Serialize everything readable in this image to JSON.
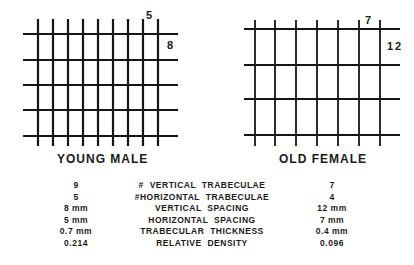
{
  "panels": [
    {
      "title": "YOUNG MALE",
      "vertical_count_label": "5",
      "horizontal_count_label": "8",
      "grid": {
        "vertical_lines_x": [
          38,
          53,
          68,
          83,
          98,
          113,
          128,
          143,
          158
        ],
        "vertical_y_range": [
          19,
          146
        ],
        "horizontal_lines_y": [
          34,
          60,
          85,
          110,
          136
        ],
        "horizontal_x_range": [
          23,
          178
        ],
        "stroke_width": 2.2
      }
    },
    {
      "title": "OLD FEMALE",
      "vertical_count_label": "7",
      "horizontal_count_label": "12",
      "grid": {
        "vertical_lines_x": [
          255,
          275,
          296,
          317,
          338,
          359,
          380
        ],
        "vertical_y_range": [
          20,
          146
        ],
        "horizontal_lines_y": [
          29,
          65,
          99,
          135
        ],
        "horizontal_x_range": [
          244,
          400
        ],
        "stroke_width": 1.8
      }
    }
  ],
  "comparison": {
    "rows": [
      {
        "young_male": "9",
        "metric": "# VERTICAL  TRABECULAE",
        "old_female": "7"
      },
      {
        "young_male": "5",
        "metric": "#HORIZONTAL  TRABECULAE",
        "old_female": "4"
      },
      {
        "young_male": "8 mm",
        "metric": "VERTICAL  SPACING",
        "old_female": "12 mm"
      },
      {
        "young_male": "5 mm",
        "metric": "HORIZONTAL  SPACING",
        "old_female": "7 mm"
      },
      {
        "young_male": "0.7 mm",
        "metric": "TRABECULAR  THICKNESS",
        "old_female": "0.4 mm"
      },
      {
        "young_male": "0.214",
        "metric": "RELATIVE  DENSITY",
        "old_female": "0.096"
      }
    ]
  },
  "colors": {
    "line": "#151515",
    "background": "#ffffff"
  }
}
